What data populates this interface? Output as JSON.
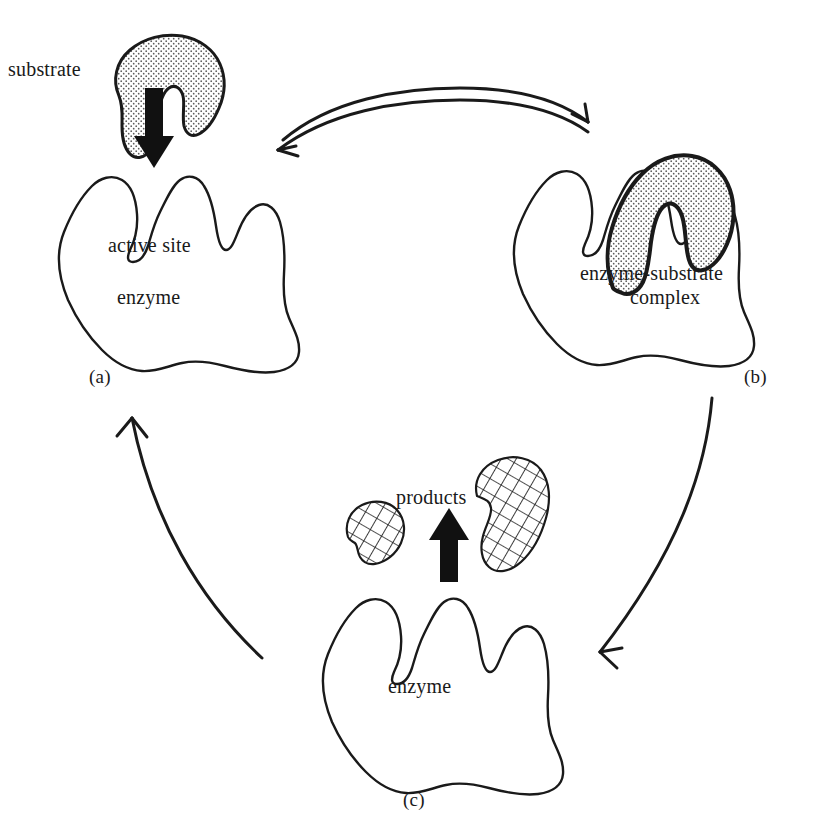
{
  "figure": {
    "type": "enzyme-substrate cycle diagram",
    "style": "black-and-white line drawing, serif labels",
    "background_color": "#ffffff",
    "line_color": "#1a1a1a"
  },
  "panels": [
    {
      "id": "a",
      "caption": "(a)",
      "labels": {
        "substrate": "substrate",
        "active_site": "active site",
        "enzyme": "enzyme"
      },
      "description": "Free enzyme with an active site; stippled substrate above, bold down arrow indicating binding"
    },
    {
      "id": "b",
      "caption": "(b)",
      "labels": {
        "complex_line1": "enzyme-substrate",
        "complex_line2": "complex"
      },
      "description": "Stippled substrate bound into the enzyme active site"
    },
    {
      "id": "c",
      "caption": "(c)",
      "labels": {
        "products": "products",
        "enzyme": "enzyme"
      },
      "description": "Two cross-hatched product fragments released above the free enzyme, bold up arrow"
    }
  ],
  "arrows": [
    {
      "name": "reversible-binding-arrow",
      "from_panel": "a",
      "to_panel": "b",
      "style": "double curved arrow (reversible)",
      "directions": [
        "right",
        "left"
      ]
    },
    {
      "name": "catalysis-arrow",
      "from_panel": "b",
      "to_panel": "c",
      "style": "single curved arrow",
      "directions": [
        "down-left"
      ]
    },
    {
      "name": "enzyme-recycle-arrow",
      "from_panel": "c",
      "to_panel": "a",
      "style": "single curved arrow",
      "directions": [
        "up"
      ]
    },
    {
      "name": "substrate-entry-arrow",
      "panel": "a",
      "style": "bold solid block arrow",
      "directions": [
        "down"
      ]
    },
    {
      "name": "product-release-arrow",
      "panel": "c",
      "style": "bold solid block arrow",
      "directions": [
        "up"
      ]
    }
  ],
  "fills": {
    "substrate_pattern": "stipple-dots",
    "product_pattern": "cross-hatch"
  }
}
